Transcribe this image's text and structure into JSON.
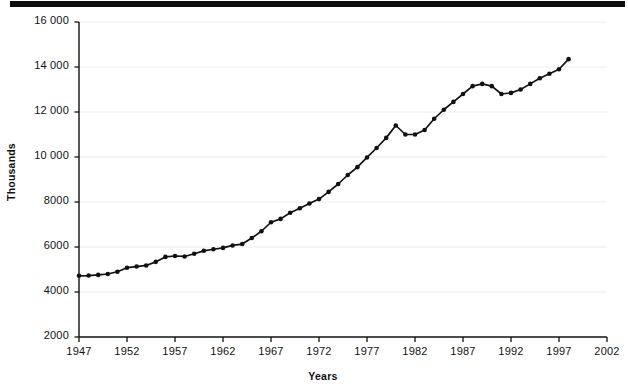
{
  "figure": {
    "topbar": "decorative-black-rule"
  },
  "chart_data": {
    "type": "line",
    "title": "",
    "subtitle": "",
    "xlabel": "Years",
    "ylabel": "Thousands",
    "grid": "horizontal-light",
    "legend": "none",
    "xlim": [
      1947,
      2002
    ],
    "ylim": [
      2000,
      16000
    ],
    "xticks": [
      "1947",
      "1952",
      "1957",
      "1962",
      "1967",
      "1972",
      "1977",
      "1982",
      "1987",
      "1992",
      "1997",
      "2002"
    ],
    "xtick_values": [
      1947,
      1952,
      1957,
      1962,
      1967,
      1972,
      1977,
      1982,
      1987,
      1992,
      1997,
      2002
    ],
    "yticks": [
      "2000",
      "4000",
      "6000",
      "8000",
      "10 000",
      "12 000",
      "14 000",
      "16 000"
    ],
    "ytick_values": [
      2000,
      4000,
      6000,
      8000,
      10000,
      12000,
      14000,
      16000
    ],
    "marker": "filled-circle",
    "line_color": "#111111",
    "marker_color": "#111111",
    "x": [
      1947,
      1948,
      1949,
      1950,
      1951,
      1952,
      1953,
      1954,
      1955,
      1956,
      1957,
      1958,
      1959,
      1960,
      1961,
      1962,
      1963,
      1964,
      1965,
      1966,
      1967,
      1968,
      1969,
      1970,
      1971,
      1972,
      1973,
      1974,
      1975,
      1976,
      1977,
      1978,
      1979,
      1980,
      1981,
      1982,
      1983,
      1984,
      1985,
      1986,
      1987,
      1988,
      1989,
      1990,
      1991,
      1992,
      1993,
      1994,
      1995,
      1996,
      1997,
      1998
    ],
    "values": [
      4720,
      4730,
      4760,
      4800,
      4900,
      5080,
      5130,
      5180,
      5340,
      5560,
      5600,
      5580,
      5700,
      5830,
      5900,
      5960,
      6070,
      6130,
      6400,
      6700,
      7100,
      7250,
      7520,
      7720,
      7930,
      8130,
      8450,
      8800,
      9200,
      9550,
      9980,
      10400,
      10850,
      11400,
      11000,
      11000,
      11200,
      11700,
      12100,
      12450,
      12800,
      13150,
      13250,
      13150,
      12800,
      12850,
      13000,
      13250,
      13500,
      13700,
      13900,
      14350
    ],
    "series": [
      {
        "name": "Total",
        "values": [
          4720,
          4730,
          4760,
          4800,
          4900,
          5080,
          5130,
          5180,
          5340,
          5560,
          5600,
          5580,
          5700,
          5830,
          5900,
          5960,
          6070,
          6130,
          6400,
          6700,
          7100,
          7250,
          7520,
          7720,
          7930,
          8130,
          8450,
          8800,
          9200,
          9550,
          9980,
          10400,
          10850,
          11400,
          11000,
          11000,
          11200,
          11700,
          12100,
          12450,
          12800,
          13150,
          13250,
          13150,
          12800,
          12850,
          13000,
          13250,
          13500,
          13700,
          13900,
          14350
        ]
      }
    ],
    "annotations": []
  }
}
